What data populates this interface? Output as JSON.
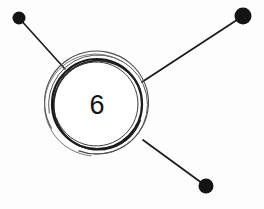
{
  "diagram": {
    "type": "node-link-sketch",
    "style": "hand-drawn",
    "canvas": {
      "width": 264,
      "height": 209
    },
    "background_color": "#fdfdfd",
    "stroke_color": "#1a1a1a",
    "central_node": {
      "label": "6",
      "center_x": 97,
      "center_y": 104,
      "outer_radius": 52,
      "inner_radius": 45,
      "label_x": 97,
      "label_y": 114,
      "fill": "#ffffff",
      "stroke": "#1a1a1a"
    },
    "endpoints": [
      {
        "name": "top-left-node",
        "cx": 19,
        "cy": 18,
        "r": 6.5,
        "fill": "#141414"
      },
      {
        "name": "top-right-node",
        "cx": 243,
        "cy": 16,
        "r": 8.5,
        "fill": "#141414"
      },
      {
        "name": "bottom-right-node",
        "cx": 206,
        "cy": 186,
        "r": 7.5,
        "fill": "#141414"
      }
    ],
    "edges": [
      {
        "name": "edge-top-left",
        "x1": 19,
        "y1": 18,
        "x2": 65,
        "y2": 69,
        "width": 1.6
      },
      {
        "name": "edge-top-right",
        "x1": 243,
        "y1": 16,
        "x2": 142,
        "y2": 82,
        "width": 1.6
      },
      {
        "name": "edge-bottom-right",
        "x1": 206,
        "y1": 186,
        "x2": 143,
        "y2": 140,
        "width": 1.6
      }
    ]
  },
  "chart_data": {
    "type": "diagram",
    "title": "",
    "nodes": [
      {
        "id": "center",
        "label": "6",
        "shape": "circle",
        "x": 97,
        "y": 104,
        "r": 52
      },
      {
        "id": "n1",
        "label": "",
        "shape": "dot",
        "x": 19,
        "y": 18,
        "r": 6.5
      },
      {
        "id": "n2",
        "label": "",
        "shape": "dot",
        "x": 243,
        "y": 16,
        "r": 8.5
      },
      {
        "id": "n3",
        "label": "",
        "shape": "dot",
        "x": 206,
        "y": 186,
        "r": 7.5
      }
    ],
    "links": [
      {
        "source": "n1",
        "target": "center"
      },
      {
        "source": "n2",
        "target": "center"
      },
      {
        "source": "n3",
        "target": "center"
      }
    ],
    "degree": 3
  }
}
